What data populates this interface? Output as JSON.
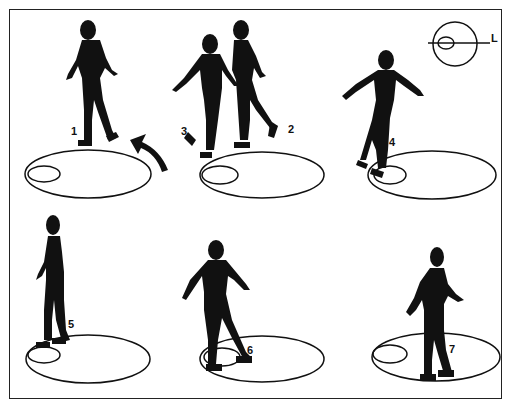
{
  "diagram": {
    "colors": {
      "ink": "#111111",
      "background": "#ffffff"
    },
    "inset": {
      "label": "L",
      "description": "large circle with small inner loop crossed by horizontal line"
    },
    "poses": [
      {
        "number": "1",
        "panel": "top-left"
      },
      {
        "number": "2",
        "panel": "top-middle"
      },
      {
        "number": "3",
        "panel": "top-middle"
      },
      {
        "number": "4",
        "panel": "top-right"
      },
      {
        "number": "5",
        "panel": "bottom-left"
      },
      {
        "number": "6",
        "panel": "bottom-middle"
      },
      {
        "number": "7",
        "panel": "bottom-right"
      }
    ],
    "arrow": {
      "direction": "curved up-left",
      "panel": "top-left"
    }
  }
}
